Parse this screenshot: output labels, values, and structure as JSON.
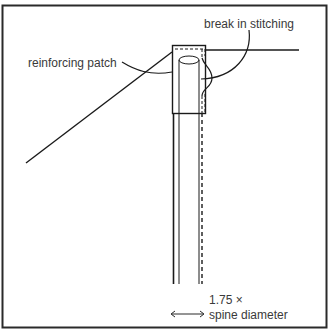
{
  "diagram": {
    "type": "technical illustration",
    "labels": {
      "reinforcing_patch": "reinforcing patch",
      "break_in_stitching": "break in stitching",
      "dimension_line1": "1.75 ×",
      "dimension_line2": "spine diameter"
    },
    "colors": {
      "line": "#1a1a1a",
      "text": "#3a3a3a",
      "background": "#ffffff"
    }
  }
}
